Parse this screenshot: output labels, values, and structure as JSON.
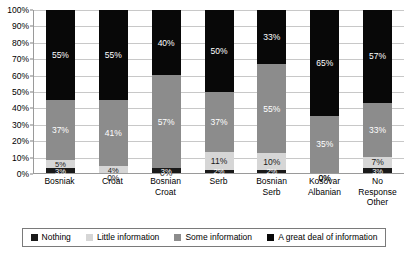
{
  "chart_data": {
    "type": "bar",
    "subtype": "100% stacked bar",
    "title": "",
    "xlabel": "",
    "ylabel": "",
    "ylim": [
      0,
      100
    ],
    "ytick_labels": [
      "100%",
      "90%",
      "80%",
      "70%",
      "60%",
      "50%",
      "40%",
      "30%",
      "20%",
      "10%",
      "0%"
    ],
    "ytick_values": [
      100,
      90,
      80,
      70,
      60,
      50,
      40,
      30,
      20,
      10,
      0
    ],
    "grid": true,
    "legend_position": "bottom",
    "categories": [
      "Bosniak",
      "Croat",
      "Bosnian Croat",
      "Serb",
      "Bosnian Serb",
      "Kosovar Albanian",
      "No Response Other"
    ],
    "series": [
      {
        "name": "Nothing",
        "color": "#1a1a1a",
        "values": [
          3,
          0,
          3,
          2,
          2,
          0,
          3
        ],
        "labels": [
          "3%",
          "0%",
          "3%",
          "2%",
          "2%",
          "0%",
          "3%"
        ]
      },
      {
        "name": "Little information",
        "color": "#d6d6d6",
        "values": [
          5,
          4,
          0,
          11,
          10,
          0,
          7
        ],
        "labels": [
          "5%",
          "4%",
          "0%",
          "11%",
          "10%",
          "0%",
          "7%"
        ]
      },
      {
        "name": "Some information",
        "color": "#8c8c8c",
        "values": [
          37,
          41,
          57,
          37,
          55,
          35,
          33
        ],
        "labels": [
          "37%",
          "41%",
          "57%",
          "37%",
          "55%",
          "35%",
          "33%"
        ]
      },
      {
        "name": "A great deal of information",
        "color": "#080808",
        "values": [
          55,
          55,
          40,
          50,
          33,
          65,
          57
        ],
        "labels": [
          "55%",
          "55%",
          "40%",
          "50%",
          "33%",
          "65%",
          "57%"
        ]
      }
    ]
  },
  "axis": {
    "y_ticks": [
      {
        "label": "100%"
      },
      {
        "label": "90%"
      },
      {
        "label": "80%"
      },
      {
        "label": "70%"
      },
      {
        "label": "60%"
      },
      {
        "label": "50%"
      },
      {
        "label": "40%"
      },
      {
        "label": "30%"
      },
      {
        "label": "20%"
      },
      {
        "label": "10%"
      },
      {
        "label": "0%"
      }
    ],
    "x_categories": [
      {
        "lines": [
          "Bosniak"
        ]
      },
      {
        "lines": [
          "Croat"
        ]
      },
      {
        "lines": [
          "Bosnian",
          "Croat"
        ]
      },
      {
        "lines": [
          "Serb"
        ]
      },
      {
        "lines": [
          "Bosnian",
          "Serb"
        ]
      },
      {
        "lines": [
          "Kosovar",
          "Albanian"
        ]
      },
      {
        "lines": [
          "No",
          "Response",
          "Other"
        ]
      }
    ]
  },
  "legend": {
    "items": [
      {
        "label": "Nothing",
        "swatch_class": "sw-nothing",
        "color": "#1a1a1a"
      },
      {
        "label": "Little information",
        "swatch_class": "sw-little",
        "color": "#d6d6d6"
      },
      {
        "label": "Some information",
        "swatch_class": "sw-some",
        "color": "#8c8c8c"
      },
      {
        "label": "A great deal of information",
        "swatch_class": "sw-great",
        "color": "#080808"
      }
    ]
  }
}
